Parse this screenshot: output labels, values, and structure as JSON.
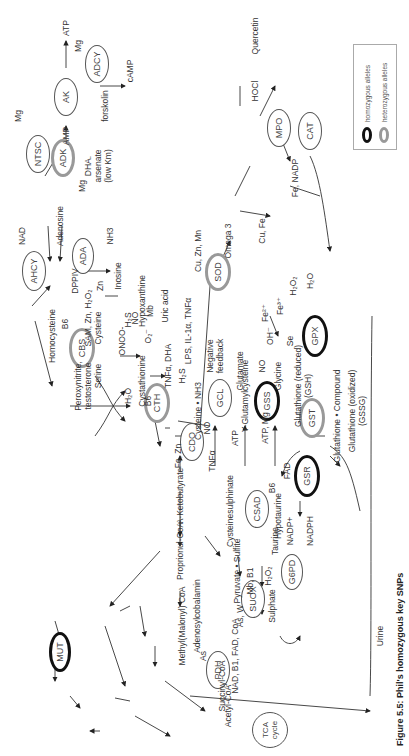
{
  "legend": {
    "homozygous": "homozygous alleles",
    "heterozygous": "heterozygous alleles",
    "colors": {
      "homozygous": "#111111",
      "heterozygous": "#999999"
    }
  },
  "caption": "Figure 5.5: Phil's homozygous key SNPs",
  "enzymes": {
    "adcy": "ADCY",
    "ak": "AK",
    "ntsc": "NTSC",
    "adk": "ADK",
    "ahcy": "AHCY",
    "ada": "ADA",
    "mpo": "MPO",
    "cat": "CAT",
    "sod": "SOD",
    "gpx": "GPX",
    "cbs": "CBS",
    "cth": "CTH",
    "gcl": "GCL",
    "gss": "GSS",
    "gst": "GST",
    "gsr": "GSR",
    "cdo": "CDO",
    "csad": "CSAD",
    "g6pd": "G6PD",
    "suox": "SUOX",
    "pdh": "PDH",
    "mut": "MUT",
    "tca": "TCA\ncycle"
  },
  "labels": {
    "atp": "ATP",
    "mg1": "Mg",
    "camp": "cAMP",
    "forskolin": "forskolin",
    "amp": "AMP",
    "mg2": "Mg",
    "mg3": "Mg",
    "dha_arsenate": "DHA.",
    "arsenate": "arsenate",
    "lowkm": "(low Km)",
    "nad": "NAD",
    "adenosine": "Adenosine",
    "dppiv": "DPPIV",
    "zn": "Zn",
    "nh3": "NH3",
    "inosine": "Inosine",
    "hypoxanthine": "Hypoxanthine",
    "mb": "Mb",
    "uric_acid": "Uric acid",
    "no": "NO",
    "o2": "O₂⁻",
    "onoo": "ONOO-",
    "cuznmn": "Cu, Zn, Mn",
    "omega3": "Omega 3",
    "lps": "LPS, IL-1α, TNFα",
    "neg_feedback1": "Negative",
    "neg_feedback2": "feedback",
    "h2o2_a": "H₂O₂",
    "h2o_a": "H₂O",
    "oh": "OH⁻",
    "fe2": "Fe²⁺",
    "fe3": "Fe³⁺",
    "se": "Se",
    "cufe": "Cu, Fe",
    "hocl": "HOCl",
    "quercetin": "Quercetin",
    "fenadp": "Fe, NADP",
    "homocysteine": "Homocysteine",
    "b6a": "B6",
    "sam": "SAM, Zn, H₂O₂",
    "cysteine_a": "Cysteine",
    "h2s_a": "H₂S",
    "h2o_b": "H₂O",
    "serine": "Serine",
    "peroxynitrite": "Peroxynitrite,",
    "testosterone": "testosterone",
    "cystathionine": "Cystathionine",
    "b6b": "B6",
    "tnfa_dha": "TNFα, DHA",
    "h2s_b": "H₂S",
    "ketobutyrate": "A-Ketobutyrate",
    "cys_nh3": "Cysteine • NH3",
    "no_b": "NO",
    "atp_b": "ATP",
    "glutamate": "Glutamate",
    "gglu": "Y-Glutamylcysteine",
    "no_c": "NO",
    "glycine": "Glycine",
    "atpmg": "ATP, Mg",
    "gsh1": "Glutathione (reduced)",
    "gsh2": "(GSH)",
    "gcomp": "Glutathione • Compound",
    "gssg1": "Glutathione (oxidized)",
    "gssg2": "(GSSG)",
    "fad": "FAD",
    "nadp": "NADP+",
    "nadph": "NADPH",
    "fezn": "Fe, Zn",
    "tnfa_b": "TNFα",
    "csulph": "Cysteinesulphinate",
    "b6c": "B6",
    "hypotaurine": "Hypotaurine",
    "taurine": "Taurine",
    "propionyl": "Proprionul-CoA",
    "adenosylcob": "Adenosylcobalamin",
    "methylmal": "Methyl(Malonyl) CoA",
    "pyrsulf": "Pyruvate • Sulfite",
    "mbb1": "Mb, B1",
    "h2o2_b": "H₂O₂",
    "asw": "As, W",
    "sulphate": "Sulphate",
    "urine": "Urine",
    "as": "As",
    "nadb1": "NAD, B1, FAD, CoA",
    "succinyl": "Succinyl-CoA",
    "acetyl": "Acetyl-CoA"
  }
}
